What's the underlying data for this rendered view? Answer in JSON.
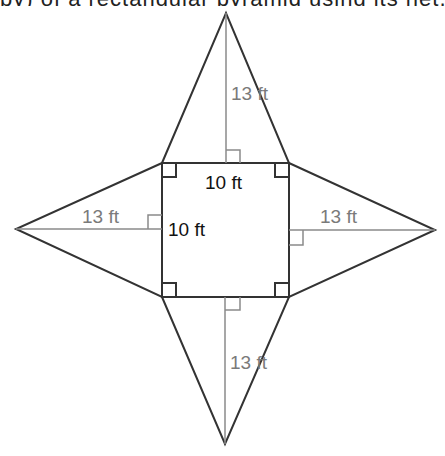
{
  "header": {
    "cut_off_text": "py) of a rectangular pyramid using its net, given the following"
  },
  "diagram": {
    "type": "net-of-square-pyramid",
    "colors": {
      "outline": "#333333",
      "height_line": "#8a8a8a",
      "label_dark": "#111111",
      "label_gray": "#7a7a7a"
    },
    "base": {
      "top_label": "10 ft",
      "side_label": "10 ft"
    },
    "triangles": {
      "top": {
        "slant_height_label": "13 ft"
      },
      "left": {
        "slant_height_label": "13 ft"
      },
      "right": {
        "slant_height_label": "13 ft"
      },
      "bottom": {
        "slant_height_label": "13 ft"
      }
    }
  }
}
